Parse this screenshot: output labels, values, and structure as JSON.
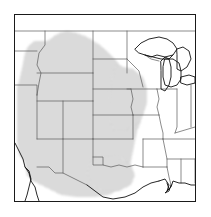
{
  "figure": {
    "kind": "species-range-map",
    "region": "Western and Central United States",
    "caption": "",
    "frame": {
      "border_color": "#1a1a1a",
      "border_width_px": 1,
      "background_color": "#ffffff",
      "x": 14,
      "y": 14,
      "width": 182,
      "height": 188
    }
  },
  "legend": {
    "shaded_meaning": "Range",
    "unshaded_meaning": "Outside range",
    "shaded_pattern": "stipple-dots",
    "shaded_color": "#8a8a8a",
    "shaded_density": "fine"
  },
  "style": {
    "state_border_color": "#5a5a5a",
    "coastline_color": "#111111",
    "lake_outline_color": "#111111",
    "land_fill_color": "#ffffff"
  },
  "map_features": {
    "coastlines": [
      "Pacific coast (California, Baja California)",
      "Gulf of Mexico coast (Texas, Louisiana, Mississippi, Alabama)",
      "Mississippi River delta"
    ],
    "great_lakes": [
      "Lake Superior",
      "Lake Michigan",
      "Lake Huron",
      "Lake Erie"
    ],
    "borders": [
      "Canada-United States border (north edge)",
      "Mexico-United States border (southwest)"
    ]
  },
  "states_shaded": [
    "Montana",
    "Wyoming",
    "Colorado",
    "Utah",
    "Nevada",
    "Idaho",
    "North Dakota",
    "South Dakota",
    "Nebraska",
    "Kansas",
    "Oklahoma",
    "New Mexico",
    "Arizona",
    "Texas (panhandle and west)"
  ],
  "states_unshaded": [
    "Minnesota",
    "Iowa",
    "Missouri",
    "Arkansas",
    "Louisiana",
    "Wisconsin",
    "Illinois",
    "Michigan",
    "Indiana",
    "Ohio",
    "Kentucky",
    "Tennessee",
    "Mississippi",
    "Alabama",
    "Georgia",
    "West Virginia",
    "Virginia",
    "North Carolina",
    "South Carolina",
    "Pennsylvania",
    "Texas (east and south)"
  ]
}
